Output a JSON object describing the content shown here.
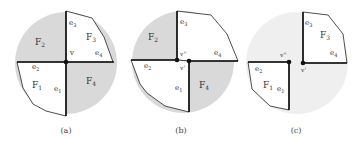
{
  "colors": {
    "shade_dark": "#d9d9d9",
    "shade_light": "#efefef",
    "edge": "#1a1a1a",
    "face_white": "#ffffff"
  },
  "panels": [
    {
      "caption": "(a)",
      "vertex_labels": [
        "v"
      ],
      "faces": [
        {
          "label": "F",
          "sub": "2",
          "shaded": true
        },
        {
          "label": "F",
          "sub": "3",
          "shaded": false
        },
        {
          "label": "F",
          "sub": "1",
          "shaded": false
        },
        {
          "label": "F",
          "sub": "4",
          "shaded": true
        }
      ],
      "edges": [
        {
          "label": "e",
          "sub": "3"
        },
        {
          "label": "e",
          "sub": "4"
        },
        {
          "label": "e",
          "sub": "2"
        },
        {
          "label": "e",
          "sub": "1"
        }
      ]
    },
    {
      "caption": "(b)",
      "vertex_labels": [
        "v''",
        "v'"
      ],
      "faces": [
        {
          "label": "F",
          "sub": "2",
          "shaded": true
        },
        {
          "label": "F",
          "sub": "4",
          "shaded": true
        }
      ],
      "edges": [
        {
          "label": "e",
          "sub": "3"
        },
        {
          "label": "e",
          "sub": "4"
        },
        {
          "label": "e",
          "sub": "2"
        },
        {
          "label": "e",
          "sub": "1"
        }
      ]
    },
    {
      "caption": "(c)",
      "vertex_labels": [
        "v''",
        "v'"
      ],
      "faces": [
        {
          "label": "F",
          "sub": "3",
          "shaded": false
        },
        {
          "label": "F",
          "sub": "1",
          "shaded": false
        }
      ],
      "edges": [
        {
          "label": "e",
          "sub": "3"
        },
        {
          "label": "e",
          "sub": "4"
        },
        {
          "label": "e",
          "sub": "2"
        },
        {
          "label": "e",
          "sub": "1"
        }
      ]
    }
  ]
}
